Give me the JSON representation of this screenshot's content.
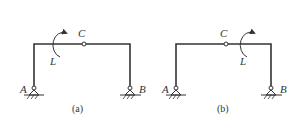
{
  "diagram": {
    "colors": {
      "line": "#333333",
      "background": "#ffffff"
    },
    "panels": [
      {
        "caption": "(a)",
        "labels": {
          "left_support": "A",
          "right_support": "B",
          "hinge": "C",
          "moment": "L"
        },
        "moment_position": "left of hinge C, clockwise arrow"
      },
      {
        "caption": "(b)",
        "labels": {
          "left_support": "A",
          "right_support": "B",
          "hinge": "C",
          "moment": "L"
        },
        "moment_position": "right of hinge C, clockwise arrow"
      }
    ]
  }
}
